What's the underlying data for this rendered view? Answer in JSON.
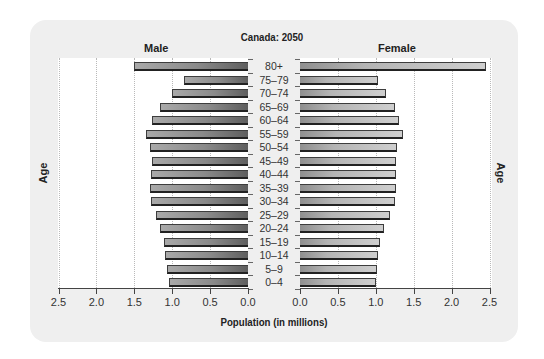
{
  "chart_data": {
    "type": "bar",
    "subtype": "population-pyramid",
    "title": "Canada: 2050",
    "xlabel": "Population (in millions)",
    "ylabel": "Age",
    "orientation": "horizontal",
    "categories": [
      "80+",
      "75–79",
      "70–74",
      "65–69",
      "60–64",
      "55–59",
      "50–54",
      "45–49",
      "40–44",
      "35–39",
      "30–34",
      "25–29",
      "20–24",
      "15–19",
      "10–14",
      "5–9",
      "0–4"
    ],
    "series": [
      {
        "name": "Male",
        "values": [
          1.5,
          0.84,
          1.0,
          1.16,
          1.26,
          1.35,
          1.29,
          1.26,
          1.28,
          1.29,
          1.28,
          1.21,
          1.16,
          1.11,
          1.09,
          1.07,
          1.04
        ]
      },
      {
        "name": "Female",
        "values": [
          2.45,
          1.03,
          1.14,
          1.25,
          1.31,
          1.36,
          1.28,
          1.26,
          1.26,
          1.27,
          1.25,
          1.19,
          1.11,
          1.06,
          1.03,
          1.02,
          1.0
        ]
      }
    ],
    "xlim": [
      0,
      2.5
    ],
    "xticks": [
      "0.0",
      "0.5",
      "1.0",
      "1.5",
      "2.0",
      "2.5"
    ],
    "left_xticks": [
      "2.5",
      "2.0",
      "1.5",
      "1.0",
      "0.5",
      "0.0"
    ],
    "grid": true,
    "legend": {
      "left": "Male",
      "right": "Female"
    }
  },
  "labels": {
    "title": "Canada: 2050",
    "male": "Male",
    "female": "Female",
    "xlabel": "Population (in millions)",
    "ylabel_left": "Age",
    "ylabel_right": "Age"
  }
}
